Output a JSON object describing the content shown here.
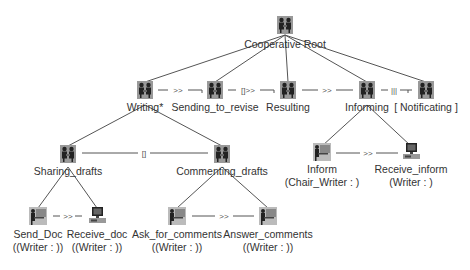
{
  "diagram": {
    "root": {
      "label": "Cooperative Root",
      "icon": "pair-icon"
    },
    "level1": [
      {
        "label": "Writing*",
        "icon": "pair-icon"
      },
      {
        "label": "Sending_to_revise",
        "icon": "pair-icon"
      },
      {
        "label": "Resulting",
        "icon": "pair-icon"
      },
      {
        "label": "Informing",
        "icon": "pair-icon"
      },
      {
        "label": "[ Notificating ]",
        "icon": "pair-icon"
      }
    ],
    "level1_relations": [
      ">>",
      "[]>>",
      ">>",
      "|||"
    ],
    "writing_children": [
      {
        "label": "Sharing_drafts",
        "icon": "pair-icon"
      },
      {
        "label": "Commenting_drafts",
        "icon": "pair-icon"
      }
    ],
    "writing_children_relation": "[]",
    "informing_children": [
      {
        "label": "Inform",
        "role": "(Chair_Writer : )",
        "icon": "user-at-desk-icon"
      },
      {
        "label": "Receive_inform",
        "role": "(Writer : )",
        "icon": "computer-icon"
      }
    ],
    "informing_children_relation": ">>",
    "sharing_children": [
      {
        "label": "Send_Doc",
        "role": "((Writer : ))",
        "icon": "user-at-desk-icon"
      },
      {
        "label": "Receive_doc",
        "role": "((Writer : ))",
        "icon": "computer-icon"
      }
    ],
    "sharing_children_relation": ">>",
    "commenting_children": [
      {
        "label": "Ask_for_comments",
        "role": "((Writer : ))",
        "icon": "user-at-desk-icon"
      },
      {
        "label": "Answer_comments",
        "role": "((Writer : ))",
        "icon": "user-at-desk-icon"
      }
    ],
    "commenting_children_relation": ">>"
  }
}
